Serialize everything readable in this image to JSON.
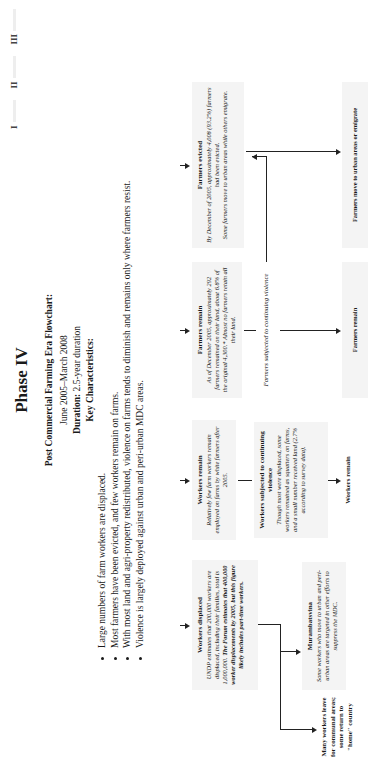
{
  "nav": {
    "items": [
      {
        "label": "I"
      },
      {
        "label": "II"
      },
      {
        "label": "III"
      },
      {
        "label": "IV",
        "active": true
      }
    ]
  },
  "header": {
    "phase_title": "Phase IV",
    "flowchart_title": "Post Commercial Farming Era Flowchart:",
    "date_range": "June 2005–March 2008",
    "duration_label": "Duration:",
    "duration_value": "2.5-year duration",
    "key_heading": "Key Characteristics:"
  },
  "characteristics": [
    "Large numbers of farm workers are displaced.",
    "Most farmers have been evicted, and few workers remain on farms.",
    "With most land and agri-property redistributed, violence on farms tends to diminish and remains only where farmers resist.",
    "Violence is largely deployed against urban and peri-urban MDC areas."
  ],
  "flowchart": {
    "workers_displaced": {
      "heading": "Workers displaced",
      "line1": "UNDP estimates that 200,000 workers are displaced, including their families, total is 1,000,000.",
      "line2": "The Forum estimates that 400,000 worker displacements by 2005,",
      "line3": "but this figure likely includes part-time workers."
    },
    "workers_remain_top": {
      "heading": "Workers remain",
      "body": "Relatively few farm workers remain employed on farms by white farmers after 2005."
    },
    "farmers_remain_top": {
      "heading": "Farmers remain",
      "body": "As of December 2005, approximately 292 farmers remained on their land, about 6.8% of the original 4,300.* Almost no farmers retain all their land."
    },
    "farmers_evicted": {
      "heading": "Farmers evicted",
      "body1": "By December of 2005, approximately 4,008 (93.2%) farmers had been evicted.",
      "body2": "Some farmers move to urban areas while others emigrate."
    },
    "workers_violence": {
      "heading": "Workers subjected to continuing violence",
      "body": "Though most were displaced, some workers remained as squatters on farms, and a small number received land (2.7% according to survey data)."
    },
    "farmers_violence": "Farmers subjected to continuing violence",
    "workers_remain_bottom": "Workers remain",
    "farmers_remain_bottom": "Farmers remain",
    "farmers_move": "Farmers move to urban areas or emigrate",
    "workers_leave": "Many workers leave for communal areas; some return to \"home\" country",
    "murambatsvina": {
      "heading": "Murambatsvina",
      "body": "Some workers who move to urban and peri-urban areas are targeted in other efforts to suppress the MDC."
    }
  }
}
